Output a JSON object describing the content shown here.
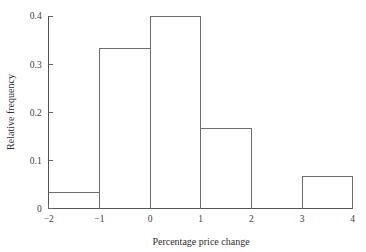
{
  "chart_data": {
    "type": "bar",
    "title": "",
    "subtitle": "",
    "xlabel": "Percentage price change",
    "ylabel": "Relative frequency",
    "xlim": [
      -2,
      4
    ],
    "ylim": [
      0,
      0.4
    ],
    "grid": false,
    "legend": "none",
    "bin_width": 1,
    "bin_edges": [
      -2,
      -1,
      0,
      1,
      2,
      3,
      4
    ],
    "categories": [
      "-2 to -1",
      "-1 to 0",
      "0 to 1",
      "1 to 2",
      "2 to 3",
      "3 to 4"
    ],
    "values": [
      0.033,
      0.333,
      0.4,
      0.167,
      0,
      0.067
    ],
    "xticks": [
      "−2",
      "−1",
      "0",
      "1",
      "2",
      "3",
      "4"
    ],
    "xtick_values": [
      -2,
      -1,
      0,
      1,
      2,
      3,
      4
    ],
    "yticks": [
      "0",
      "0.1",
      "0.2",
      "0.3",
      "0.4"
    ],
    "ytick_values": [
      0,
      0.1,
      0.2,
      0.3,
      0.4
    ],
    "bar_edge_color": "#6e6e6e",
    "bar_fill_color": "none",
    "axis_color": "#545454"
  }
}
